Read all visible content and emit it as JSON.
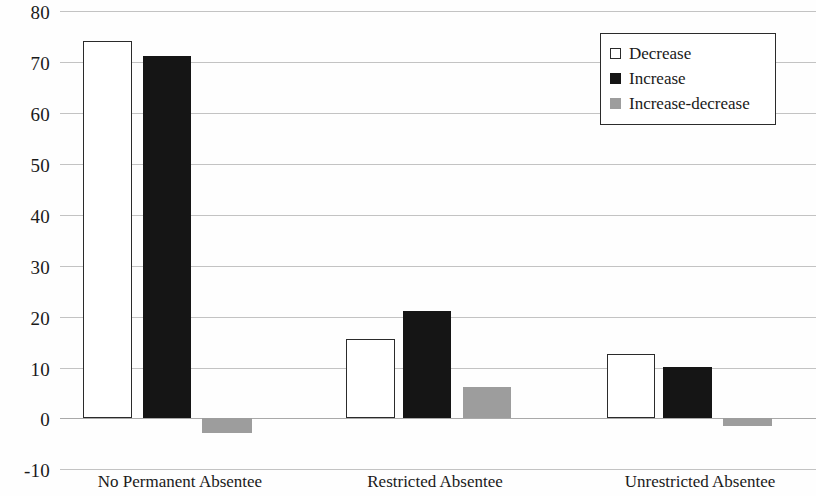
{
  "chart_data": {
    "type": "bar",
    "title": "",
    "subtitle": "",
    "xlabel": "",
    "ylabel": "",
    "categories": [
      "No Permanent Absentee",
      "Restricted Absentee",
      "Unrestricted Absentee"
    ],
    "series": [
      {
        "name": "Decrease",
        "color": "#ffffff",
        "values": [
          74,
          15.5,
          12.5
        ]
      },
      {
        "name": "Increase",
        "color": "#151515",
        "values": [
          71,
          21,
          10
        ]
      },
      {
        "name": "Increase-decrease",
        "color": "#9d9d9d",
        "values": [
          -3,
          6,
          -1.5
        ]
      }
    ],
    "ylim": [
      -10,
      80
    ],
    "yticks": [
      80,
      70,
      60,
      50,
      40,
      30,
      20,
      10,
      0,
      -10
    ],
    "ytick_labels": [
      "80",
      "70",
      "60",
      "50",
      "40",
      "30",
      "20",
      "10",
      "0",
      "-10"
    ],
    "grid": true,
    "legend_position": "top-right",
    "legend_entries": [
      "Decrease",
      "Increase",
      "Increase-decrease"
    ]
  },
  "axis": {
    "tick_80": "80",
    "tick_70": "70",
    "tick_60": "60",
    "tick_50": "50",
    "tick_40": "40",
    "tick_30": "30",
    "tick_20": "20",
    "tick_10": "10",
    "tick_0": "0",
    "tick_neg10": "-10"
  },
  "categories": {
    "cat_0": "No Permanent Absentee",
    "cat_1": "Restricted Absentee",
    "cat_2": "Unrestricted Absentee"
  },
  "legend": {
    "item_0": "Decrease",
    "item_1": "Increase",
    "item_2": "Increase-decrease"
  }
}
